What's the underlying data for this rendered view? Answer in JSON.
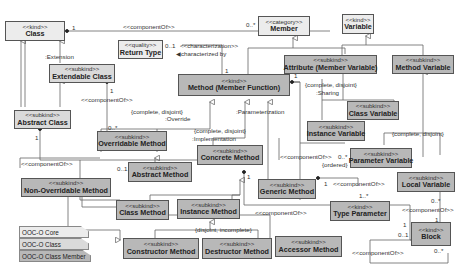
{
  "diagram": {
    "type": "UML class diagram (OntoUML)",
    "colors": {
      "core": "#ececec",
      "class": "#dadada",
      "class_member": "#b8b8b8",
      "border": "#555555"
    },
    "boxes": {
      "class": {
        "stereotype": "<<kind>>",
        "name": "Class",
        "package": "core"
      },
      "extendable_class": {
        "stereotype": "<<subkind>>",
        "name": "Extendable Class",
        "package": "class"
      },
      "abstract_class": {
        "stereotype": "<<subkind>>",
        "name": "Abstract Class",
        "package": "class"
      },
      "return_type": {
        "stereotype": "<<quality>>",
        "name": "Return Type",
        "package": "core"
      },
      "member": {
        "stereotype": "<<category>>",
        "name": "Member",
        "package": "core"
      },
      "variable": {
        "stereotype": "<<kind>>",
        "name": "Variable",
        "package": "core"
      },
      "attribute": {
        "stereotype": "<<subkind>>",
        "name": "Attribute (Member Variable)",
        "package": "class_member"
      },
      "method_variable": {
        "stereotype": "<<subkind>>",
        "name": "Method Variable",
        "package": "class_member"
      },
      "method": {
        "stereotype": "<<kind>>",
        "name": "Method (Member Function)",
        "package": "class_member"
      },
      "class_variable": {
        "stereotype": "<<subkind>>",
        "name": "Class Variable",
        "package": "class_member"
      },
      "instance_variable": {
        "stereotype": "<<subkind>>",
        "name": "Instance Variable",
        "package": "class_member"
      },
      "overridable_method": {
        "stereotype": "<<subkind>>",
        "name": "Overridable Method",
        "package": "class_member"
      },
      "concrete_method": {
        "stereotype": "<<subkind>>",
        "name": "Concrete Method",
        "package": "class_member"
      },
      "abstract_method": {
        "stereotype": "<<subkind>>",
        "name": "Abstract Method",
        "package": "class_member"
      },
      "parameter_variable": {
        "stereotype": "<<subkind>>",
        "name": "Parameter Variable",
        "package": "class_member"
      },
      "non_overridable_method": {
        "stereotype": "<<subkind>>",
        "name": "Non-Overridable Method",
        "package": "class_member"
      },
      "generic_method": {
        "stereotype": "<<subkind>>",
        "name": "Generic Method",
        "package": "class_member"
      },
      "local_variable": {
        "stereotype": "<<subkind>>",
        "name": "Local Variable",
        "package": "class_member"
      },
      "class_method": {
        "stereotype": "<<subkind>>",
        "name": "Class Method",
        "package": "class_member"
      },
      "instance_method": {
        "stereotype": "<<subkind>>",
        "name": "Instance Method",
        "package": "class_member"
      },
      "type_parameter": {
        "stereotype": "<<kind>>",
        "name": "Type Parameter",
        "package": "class_member"
      },
      "block": {
        "stereotype": "<<kind>>",
        "name": "Block",
        "package": "class_member"
      },
      "constructor_method": {
        "stereotype": "<<subkind>>",
        "name": "Constructor Method",
        "package": "class_member"
      },
      "destructor_method": {
        "stereotype": "<<subkind>>",
        "name": "Destructor Method",
        "package": "class_member"
      },
      "accessor_method": {
        "stereotype": "<<subkind>>",
        "name": "Accessor Method",
        "package": "class_member"
      }
    },
    "labels": {
      "component_of": "<<componentOf>>",
      "characterization": "<<characterization>>",
      "characterized_by": "characterized by",
      "extension": ":Extension",
      "override": ":Override",
      "implementation": ":Implementation",
      "parameterization": ":Parameterization",
      "sharing": ":Sharing",
      "complete_disjoint": "{complete, disjoint}",
      "disjoint_incomplete": "{disjoint, incomplete}",
      "ordered": "{ordered}",
      "m_1": "1",
      "m_0_star": "0..*",
      "m_0_1": "0..1",
      "m_1_star": "1..*"
    },
    "legend": [
      {
        "label": "OOC-O Core",
        "color": "#ececec"
      },
      {
        "label": "OOC-O Class",
        "color": "#dadada"
      },
      {
        "label": "OOC-O Class Member",
        "color": "#b8b8b8"
      }
    ]
  }
}
